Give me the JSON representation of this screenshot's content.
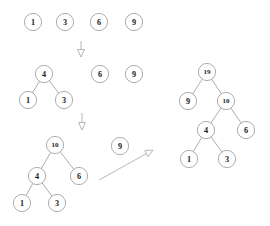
{
  "diagram": {
    "type": "binary-search-tree-construction",
    "canvas": {
      "width": 270,
      "height": 226
    },
    "style": {
      "node_stroke": "#8a8a8a",
      "node_fill": "#ffffff",
      "edge_stroke": "#8a8a8a",
      "arrow_stroke": "#9a9a9a",
      "label_color": "#1a1a1a",
      "node_radius": 8.6,
      "node_font_size": 8.2,
      "node_font_size_small": 7.0
    },
    "stages": [
      {
        "id": "stage-1-loose-nodes",
        "name": "initial-loose-nodes",
        "nodes": [
          {
            "id": "s1-n1",
            "label": "1",
            "cx": 33,
            "cy": 22
          },
          {
            "id": "s1-n3",
            "label": "3",
            "cx": 65,
            "cy": 22
          },
          {
            "id": "s1-n6",
            "label": "6",
            "cx": 99,
            "cy": 22
          },
          {
            "id": "s1-n9",
            "label": "9",
            "cx": 134,
            "cy": 22
          }
        ],
        "edges": []
      },
      {
        "id": "stage-2-subtree-and-loose",
        "name": "subtree-4-and-loose-nodes",
        "nodes": [
          {
            "id": "s2-n4",
            "label": "4",
            "cx": 44,
            "cy": 74
          },
          {
            "id": "s2-n1",
            "label": "1",
            "cx": 28,
            "cy": 100
          },
          {
            "id": "s2-n3",
            "label": "3",
            "cx": 64,
            "cy": 100
          },
          {
            "id": "s2-n6",
            "label": "6",
            "cx": 100,
            "cy": 74
          },
          {
            "id": "s2-n9",
            "label": "9",
            "cx": 134,
            "cy": 74
          }
        ],
        "edges": [
          {
            "from": "s2-n4",
            "to": "s2-n1"
          },
          {
            "from": "s2-n4",
            "to": "s2-n3"
          }
        ]
      },
      {
        "id": "stage-3-tree-10",
        "name": "tree-rooted-at-10",
        "nodes": [
          {
            "id": "s3-n10",
            "label": "10",
            "cx": 55,
            "cy": 145
          },
          {
            "id": "s3-n4",
            "label": "4",
            "cx": 37,
            "cy": 176
          },
          {
            "id": "s3-n6",
            "label": "6",
            "cx": 79,
            "cy": 176
          },
          {
            "id": "s3-n1",
            "label": "1",
            "cx": 22,
            "cy": 203
          },
          {
            "id": "s3-n3",
            "label": "3",
            "cx": 57,
            "cy": 203
          }
        ],
        "edges": [
          {
            "from": "s3-n10",
            "to": "s3-n4"
          },
          {
            "from": "s3-n10",
            "to": "s3-n6"
          },
          {
            "from": "s3-n4",
            "to": "s3-n1"
          },
          {
            "from": "s3-n4",
            "to": "s3-n3"
          }
        ]
      },
      {
        "id": "stage-3-loose-9",
        "name": "loose-node-9",
        "nodes": [
          {
            "id": "s3-n9",
            "label": "9",
            "cx": 120,
            "cy": 146
          }
        ],
        "edges": []
      },
      {
        "id": "stage-4-tree-19",
        "name": "final-tree-rooted-at-19",
        "nodes": [
          {
            "id": "s4-n19",
            "label": "19",
            "cx": 207,
            "cy": 72
          },
          {
            "id": "s4-n9",
            "label": "9",
            "cx": 188,
            "cy": 101
          },
          {
            "id": "s4-n10",
            "label": "10",
            "cx": 226,
            "cy": 101
          },
          {
            "id": "s4-n4",
            "label": "4",
            "cx": 206,
            "cy": 130
          },
          {
            "id": "s4-n6",
            "label": "6",
            "cx": 246,
            "cy": 130
          },
          {
            "id": "s4-n1",
            "label": "1",
            "cx": 189,
            "cy": 159
          },
          {
            "id": "s4-n3",
            "label": "3",
            "cx": 227,
            "cy": 159
          }
        ],
        "edges": [
          {
            "from": "s4-n19",
            "to": "s4-n9"
          },
          {
            "from": "s4-n19",
            "to": "s4-n10"
          },
          {
            "from": "s4-n10",
            "to": "s4-n4"
          },
          {
            "from": "s4-n10",
            "to": "s4-n6"
          },
          {
            "from": "s4-n4",
            "to": "s4-n1"
          },
          {
            "from": "s4-n4",
            "to": "s4-n3"
          }
        ]
      }
    ],
    "arrows": [
      {
        "id": "arrow-down-1",
        "name": "transition-arrow-stage1-to-stage2",
        "x1": 81,
        "y1": 41,
        "x2": 81,
        "y2": 57
      },
      {
        "id": "arrow-down-2",
        "name": "transition-arrow-stage2-to-stage3",
        "x1": 82,
        "y1": 113,
        "x2": 82,
        "y2": 130
      },
      {
        "id": "arrow-diagonal",
        "name": "transition-arrow-stage3-to-final",
        "x1": 99,
        "y1": 180,
        "x2": 153,
        "y2": 150
      }
    ]
  }
}
